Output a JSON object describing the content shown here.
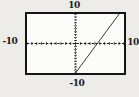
{
  "figure": {
    "background_color": "#edece8",
    "plot_background_color": "#fcfcfa",
    "border_color": "#151515",
    "axis_color": "#1a1a1a",
    "line_color": "#222222"
  },
  "chart_data": {
    "type": "line",
    "title": "",
    "xlabel": "",
    "ylabel": "",
    "window": {
      "xmin": -10,
      "xmax": 10,
      "ymin": -10,
      "ymax": 10,
      "xscl": 1,
      "yscl": 1
    },
    "grid": false,
    "legend": false,
    "axes_style": "dashed-with-unit-ticks",
    "series": [
      {
        "name": "graphed-line",
        "points": [
          [
            0,
            -10
          ],
          [
            9,
            10
          ]
        ],
        "x_intercept_approx": 4.5,
        "y_intercept_approx": -10
      }
    ],
    "window_labels": {
      "top": "10",
      "bottom": "-10",
      "left": "-10",
      "right": "10"
    }
  }
}
